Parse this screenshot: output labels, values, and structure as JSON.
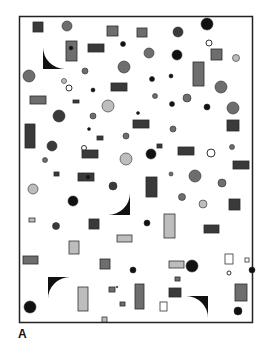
{
  "figure": {
    "panel_label": "A",
    "colors": {
      "frame": "#222222",
      "background": "#ffffff",
      "dark": "#111111",
      "dark_gray": "#3a3a3a",
      "mid_gray": "#6e6e6e",
      "light_gray": "#bdbdbd",
      "outline": "#333333"
    },
    "shapes": [
      {
        "kind": "rect",
        "name": "square-dark",
        "x": 33,
        "y": 22,
        "w": 10,
        "h": 10,
        "fill": "dark_gray"
      },
      {
        "kind": "circle",
        "name": "circle-gradient",
        "cx": 67,
        "cy": 26,
        "r": 5,
        "fill": "mid_gray"
      },
      {
        "kind": "rect",
        "name": "rect-dark",
        "x": 107,
        "y": 26,
        "w": 11,
        "h": 10,
        "fill": "mid_gray"
      },
      {
        "kind": "rect",
        "name": "square-dark",
        "x": 137,
        "y": 28,
        "w": 10,
        "h": 9,
        "fill": "mid_gray"
      },
      {
        "kind": "circle",
        "name": "circle-dark",
        "cx": 178,
        "cy": 32,
        "r": 5,
        "fill": "dark_gray"
      },
      {
        "kind": "circle",
        "name": "circle-black",
        "cx": 207,
        "cy": 24,
        "r": 6,
        "fill": "dark"
      },
      {
        "kind": "wedge",
        "name": "wedge-top-left",
        "x": 43,
        "y": 47,
        "size": 22,
        "orient": "bl"
      },
      {
        "kind": "rect",
        "name": "rect-with-dot",
        "x": 66,
        "y": 41,
        "w": 11,
        "h": 20,
        "fill": "mid_gray"
      },
      {
        "kind": "circle",
        "name": "dot-black",
        "cx": 71,
        "cy": 48,
        "r": 2,
        "fill": "dark"
      },
      {
        "kind": "rect",
        "name": "rect-dark",
        "x": 88,
        "y": 44,
        "w": 16,
        "h": 8,
        "fill": "dark_gray"
      },
      {
        "kind": "circle",
        "name": "dot-black",
        "cx": 123,
        "cy": 44,
        "r": 2.5,
        "fill": "dark"
      },
      {
        "kind": "circle",
        "name": "circle-outline",
        "cx": 209,
        "cy": 43,
        "r": 3,
        "fill": "none"
      },
      {
        "kind": "circle",
        "name": "circle-gray",
        "cx": 149,
        "cy": 53,
        "r": 5,
        "fill": "mid_gray"
      },
      {
        "kind": "circle",
        "name": "circle-half",
        "cx": 177,
        "cy": 55,
        "r": 5,
        "fill": "dark"
      },
      {
        "kind": "rect",
        "name": "square-dark",
        "x": 211,
        "y": 49,
        "w": 11,
        "h": 11,
        "fill": "mid_gray"
      },
      {
        "kind": "circle",
        "name": "circle-light",
        "cx": 236,
        "cy": 58,
        "r": 3.5,
        "fill": "light_gray"
      },
      {
        "kind": "circle",
        "name": "circle-gray",
        "cx": 29,
        "cy": 76,
        "r": 6,
        "fill": "mid_gray"
      },
      {
        "kind": "circle",
        "name": "circle-gray",
        "cx": 85,
        "cy": 71,
        "r": 3,
        "fill": "mid_gray"
      },
      {
        "kind": "circle",
        "name": "circle-gray",
        "cx": 124,
        "cy": 67,
        "r": 6,
        "fill": "mid_gray"
      },
      {
        "kind": "circle",
        "name": "dot-black",
        "cx": 152,
        "cy": 79,
        "r": 2.5,
        "fill": "dark"
      },
      {
        "kind": "circle",
        "name": "dot-black",
        "cx": 171,
        "cy": 76,
        "r": 2,
        "fill": "dark"
      },
      {
        "kind": "rect",
        "name": "rect-tall-circle",
        "x": 193,
        "y": 62,
        "w": 11,
        "h": 24,
        "fill": "mid_gray"
      },
      {
        "kind": "circle",
        "name": "circle-gray",
        "cx": 221,
        "cy": 87,
        "r": 6,
        "fill": "mid_gray"
      },
      {
        "kind": "circle",
        "name": "circle-gray",
        "cx": 64,
        "cy": 81,
        "r": 2.5,
        "fill": "light_gray"
      },
      {
        "kind": "circle",
        "name": "circle-outline",
        "cx": 69,
        "cy": 88,
        "r": 3,
        "fill": "none"
      },
      {
        "kind": "circle",
        "name": "dot-black",
        "cx": 93,
        "cy": 90,
        "r": 2,
        "fill": "dark"
      },
      {
        "kind": "rect",
        "name": "rect-dark",
        "x": 111,
        "y": 83,
        "w": 16,
        "h": 8,
        "fill": "dark_gray"
      },
      {
        "kind": "rect",
        "name": "rect-dark",
        "x": 30,
        "y": 96,
        "w": 16,
        "h": 8,
        "fill": "mid_gray"
      },
      {
        "kind": "rect",
        "name": "rect-small",
        "x": 73,
        "y": 100,
        "w": 6,
        "h": 3,
        "fill": "dark_gray"
      },
      {
        "kind": "circle",
        "name": "circle-half-light",
        "cx": 108,
        "cy": 106,
        "r": 6,
        "fill": "light_gray"
      },
      {
        "kind": "circle",
        "name": "circle-gray",
        "cx": 155,
        "cy": 96,
        "r": 2.5,
        "fill": "mid_gray"
      },
      {
        "kind": "circle",
        "name": "dot-black",
        "cx": 172,
        "cy": 104,
        "r": 2.5,
        "fill": "dark"
      },
      {
        "kind": "circle",
        "name": "circle-gray",
        "cx": 187,
        "cy": 98,
        "r": 4,
        "fill": "mid_gray"
      },
      {
        "kind": "circle",
        "name": "dot-black",
        "cx": 207,
        "cy": 107,
        "r": 3,
        "fill": "dark"
      },
      {
        "kind": "circle",
        "name": "circle-gray",
        "cx": 233,
        "cy": 108,
        "r": 6,
        "fill": "mid_gray"
      },
      {
        "kind": "circle",
        "name": "circle-dark",
        "cx": 59,
        "cy": 116,
        "r": 6,
        "fill": "dark_gray"
      },
      {
        "kind": "circle",
        "name": "circle-gray",
        "cx": 93,
        "cy": 116,
        "r": 3,
        "fill": "mid_gray"
      },
      {
        "kind": "circle",
        "name": "dot-black",
        "cx": 138,
        "cy": 113,
        "r": 1.5,
        "fill": "dark"
      },
      {
        "kind": "circle",
        "name": "dot-black",
        "cx": 89,
        "cy": 129,
        "r": 1.5,
        "fill": "dark"
      },
      {
        "kind": "rect",
        "name": "rect-tall-circle",
        "x": 25,
        "y": 124,
        "w": 10,
        "h": 24,
        "fill": "dark_gray"
      },
      {
        "kind": "rect",
        "name": "rect-small",
        "x": 97,
        "y": 136,
        "w": 6,
        "h": 4,
        "fill": "dark_gray"
      },
      {
        "kind": "circle",
        "name": "circle-gray",
        "cx": 126,
        "cy": 136,
        "r": 3,
        "fill": "mid_gray"
      },
      {
        "kind": "rect",
        "name": "rect-dark",
        "x": 133,
        "y": 120,
        "w": 16,
        "h": 8,
        "fill": "dark_gray"
      },
      {
        "kind": "circle",
        "name": "circle-gray",
        "cx": 173,
        "cy": 129,
        "r": 3,
        "fill": "mid_gray"
      },
      {
        "kind": "rect",
        "name": "square-dark",
        "x": 227,
        "y": 120,
        "w": 12,
        "h": 11,
        "fill": "dark_gray"
      },
      {
        "kind": "circle",
        "name": "circle-dark",
        "cx": 52,
        "cy": 146,
        "r": 5,
        "fill": "dark_gray"
      },
      {
        "kind": "circle",
        "name": "circle-gray",
        "cx": 45,
        "cy": 160,
        "r": 2.5,
        "fill": "mid_gray"
      },
      {
        "kind": "circle",
        "name": "circle-outline",
        "cx": 84,
        "cy": 148,
        "r": 2.5,
        "fill": "none"
      },
      {
        "kind": "rect",
        "name": "rect-dark",
        "x": 82,
        "y": 150,
        "w": 16,
        "h": 8,
        "fill": "dark_gray"
      },
      {
        "kind": "circle",
        "name": "circle-half-light",
        "cx": 126,
        "cy": 159,
        "r": 6,
        "fill": "light_gray"
      },
      {
        "kind": "circle",
        "name": "circle-dark",
        "cx": 151,
        "cy": 154,
        "r": 5,
        "fill": "dark"
      },
      {
        "kind": "rect",
        "name": "rect-small",
        "x": 157,
        "y": 144,
        "w": 5,
        "h": 4,
        "fill": "dark_gray"
      },
      {
        "kind": "rect",
        "name": "rect-dark",
        "x": 178,
        "y": 147,
        "w": 16,
        "h": 8,
        "fill": "dark_gray"
      },
      {
        "kind": "circle",
        "name": "circle-outline",
        "cx": 211,
        "cy": 153,
        "r": 4,
        "fill": "none"
      },
      {
        "kind": "circle",
        "name": "circle-gray",
        "cx": 232,
        "cy": 147,
        "r": 2.5,
        "fill": "mid_gray"
      },
      {
        "kind": "rect",
        "name": "rect-dark",
        "x": 233,
        "y": 161,
        "w": 16,
        "h": 8,
        "fill": "dark_gray"
      },
      {
        "kind": "rect",
        "name": "rect-small",
        "x": 54,
        "y": 172,
        "w": 5,
        "h": 4,
        "fill": "dark_gray"
      },
      {
        "kind": "rect",
        "name": "rect-with-dot",
        "x": 78,
        "y": 173,
        "w": 16,
        "h": 8,
        "fill": "dark_gray"
      },
      {
        "kind": "circle",
        "name": "dot-black",
        "cx": 88,
        "cy": 177,
        "r": 2,
        "fill": "dark"
      },
      {
        "kind": "circle",
        "name": "circle-gray",
        "cx": 171,
        "cy": 174,
        "r": 2,
        "fill": "mid_gray"
      },
      {
        "kind": "circle",
        "name": "circle-gray",
        "cx": 195,
        "cy": 176,
        "r": 6,
        "fill": "mid_gray"
      },
      {
        "kind": "circle",
        "name": "circle-gray",
        "cx": 222,
        "cy": 183,
        "r": 4,
        "fill": "mid_gray"
      },
      {
        "kind": "circle",
        "name": "circle-half-light",
        "cx": 33,
        "cy": 189,
        "r": 5,
        "fill": "light_gray"
      },
      {
        "kind": "circle",
        "name": "circle-dark",
        "cx": 113,
        "cy": 186,
        "r": 4,
        "fill": "dark_gray"
      },
      {
        "kind": "rect",
        "name": "rect-tall",
        "x": 146,
        "y": 177,
        "w": 11,
        "h": 20,
        "fill": "dark_gray"
      },
      {
        "kind": "circle",
        "name": "circle-dark",
        "cx": 73,
        "cy": 201,
        "r": 5,
        "fill": "dark"
      },
      {
        "kind": "circle",
        "name": "circle-gray",
        "cx": 182,
        "cy": 197,
        "r": 3.5,
        "fill": "mid_gray"
      },
      {
        "kind": "circle",
        "name": "circle-gray",
        "cx": 203,
        "cy": 204,
        "r": 4,
        "fill": "light_gray"
      },
      {
        "kind": "rect",
        "name": "square-dark",
        "x": 229,
        "y": 199,
        "w": 11,
        "h": 11,
        "fill": "dark_gray"
      },
      {
        "kind": "wedge",
        "name": "wedge-mid-right",
        "x": 108,
        "y": 193,
        "size": 22,
        "orient": "br"
      },
      {
        "kind": "rect",
        "name": "rect-small-light",
        "x": 29,
        "y": 218,
        "w": 6,
        "h": 4,
        "fill": "light_gray"
      },
      {
        "kind": "circle",
        "name": "circle-dark",
        "cx": 56,
        "cy": 226,
        "r": 3.5,
        "fill": "dark_gray"
      },
      {
        "kind": "rect",
        "name": "square-dark",
        "x": 89,
        "y": 219,
        "w": 10,
        "h": 10,
        "fill": "dark_gray"
      },
      {
        "kind": "circle",
        "name": "dot-black",
        "cx": 147,
        "cy": 223,
        "r": 3,
        "fill": "dark"
      },
      {
        "kind": "rect",
        "name": "rect-tall-outline",
        "x": 164,
        "y": 214,
        "w": 11,
        "h": 24,
        "fill": "light_gray"
      },
      {
        "kind": "rect",
        "name": "rect-dark",
        "x": 204,
        "y": 225,
        "w": 15,
        "h": 8,
        "fill": "dark_gray"
      },
      {
        "kind": "rect",
        "name": "rect-light-outline",
        "x": 117,
        "y": 235,
        "w": 15,
        "h": 7,
        "fill": "light_gray"
      },
      {
        "kind": "rect",
        "name": "rect-light-outline",
        "x": 69,
        "y": 241,
        "w": 10,
        "h": 13,
        "fill": "light_gray"
      },
      {
        "kind": "rect",
        "name": "rect-gray",
        "x": 23,
        "y": 256,
        "w": 15,
        "h": 8,
        "fill": "mid_gray"
      },
      {
        "kind": "rect",
        "name": "square-gray",
        "x": 100,
        "y": 259,
        "w": 10,
        "h": 10,
        "fill": "mid_gray"
      },
      {
        "kind": "rect",
        "name": "rect-light-outline",
        "x": 169,
        "y": 261,
        "w": 15,
        "h": 7,
        "fill": "light_gray"
      },
      {
        "kind": "circle",
        "name": "circle-black",
        "cx": 192,
        "cy": 266,
        "r": 6,
        "fill": "dark"
      },
      {
        "kind": "rect",
        "name": "square-outline",
        "x": 225,
        "y": 254,
        "w": 8,
        "h": 10,
        "fill": "none"
      },
      {
        "kind": "rect",
        "name": "square-outline-small",
        "x": 245,
        "y": 258,
        "w": 4,
        "h": 4,
        "fill": "none"
      },
      {
        "kind": "circle",
        "name": "circle-outline-small",
        "cx": 229,
        "cy": 273,
        "r": 2,
        "fill": "none"
      },
      {
        "kind": "circle",
        "name": "dot-black",
        "cx": 133,
        "cy": 270,
        "r": 3,
        "fill": "dark"
      },
      {
        "kind": "circle",
        "name": "dot-black",
        "cx": 252,
        "cy": 270,
        "r": 3,
        "fill": "dark"
      },
      {
        "kind": "wedge",
        "name": "wedge-bottom-left",
        "x": 48,
        "y": 277,
        "size": 22,
        "orient": "tl"
      },
      {
        "kind": "rect",
        "name": "rect-tall-light",
        "x": 78,
        "y": 287,
        "w": 10,
        "h": 24,
        "fill": "light_gray"
      },
      {
        "kind": "rect",
        "name": "rect-small-outlined",
        "x": 109,
        "y": 287,
        "w": 6,
        "h": 5,
        "fill": "mid_gray"
      },
      {
        "kind": "circle",
        "name": "dot-black",
        "cx": 117,
        "cy": 287,
        "r": 0.8,
        "fill": "dark"
      },
      {
        "kind": "rect",
        "name": "rect-small",
        "x": 120,
        "y": 302,
        "w": 5,
        "h": 4,
        "fill": "mid_gray"
      },
      {
        "kind": "rect",
        "name": "square-light-outline",
        "x": 102,
        "y": 317,
        "w": 5,
        "h": 5,
        "fill": "light_gray"
      },
      {
        "kind": "rect",
        "name": "rect-small",
        "x": 175,
        "y": 277,
        "w": 5,
        "h": 4,
        "fill": "mid_gray"
      },
      {
        "kind": "rect",
        "name": "rect-tall-circle",
        "x": 135,
        "y": 284,
        "w": 9,
        "h": 25,
        "fill": "mid_gray"
      },
      {
        "kind": "rect",
        "name": "rect-with-dot",
        "x": 169,
        "y": 288,
        "w": 12,
        "h": 9,
        "fill": "dark_gray"
      },
      {
        "kind": "rect",
        "name": "square-outline",
        "x": 160,
        "y": 302,
        "w": 7,
        "h": 9,
        "fill": "none"
      },
      {
        "kind": "wedge",
        "name": "wedge-bottom-right",
        "x": 186,
        "y": 296,
        "size": 22,
        "orient": "tr"
      },
      {
        "kind": "rect",
        "name": "rect-tall-circle",
        "x": 235,
        "y": 284,
        "w": 12,
        "h": 17,
        "fill": "mid_gray"
      },
      {
        "kind": "circle",
        "name": "circle-black",
        "cx": 238,
        "cy": 311,
        "r": 4,
        "fill": "dark"
      },
      {
        "kind": "circle",
        "name": "circle-black",
        "cx": 30,
        "cy": 307,
        "r": 6,
        "fill": "dark"
      }
    ]
  }
}
